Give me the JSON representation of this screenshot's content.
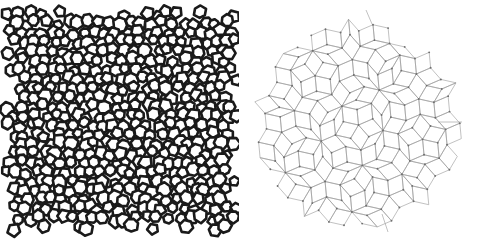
{
  "figure": {
    "background_color": "#ffffff",
    "width": 477,
    "height": 243,
    "panel_count": 2,
    "left_panel_caption": "",
    "right_panel_caption": ""
  },
  "panels": [
    {
      "id": "amorphous-network",
      "name": "Amorphous polygon network",
      "description": "Densely packed disordered network of thick-walled polygon rings (mostly pentagons and hexagons) filling a square region with ragged edges.",
      "style": {
        "line_color": "#1a1a1a",
        "fill_color": "#ffffff",
        "background_color": "#ffffff",
        "wall_thickness": 2.6,
        "ring_radius_mean": 6.2,
        "ring_radius_jitter": 1.1,
        "sides_min": 5,
        "sides_max": 7
      },
      "bounds": {
        "x": 9,
        "y": 14,
        "width": 225,
        "height": 214
      },
      "lattice": {
        "type": "jittered-triangular",
        "spacing": 10.6,
        "row_offset": 0.5,
        "jitter_amplitude": 2.9,
        "seed": 20240517
      }
    },
    {
      "id": "rhombus-tiling",
      "name": "Quasiperiodic rhombus tiling",
      "description": "Penrose-like tiling of fat and thin rhombi drawn with thin grey lines and small vertex dots, forming a roughly decagonal patch.",
      "style": {
        "line_color": "#9a9a9a",
        "vertex_color": "#6e6e6e",
        "fill_color": "none",
        "background_color": "#ffffff",
        "line_width": 0.62,
        "vertex_radius": 0.95,
        "edge_length": 15.5
      },
      "bounds": {
        "x": 262,
        "y": 20,
        "width": 193,
        "height": 210
      },
      "lattice": {
        "type": "de-bruijn-pentagrid",
        "symmetry": 5,
        "grid_lines_per_family": 9,
        "offsets": [
          0.18,
          0.31,
          0.22,
          0.14,
          0.27
        ],
        "clip_radius": 96
      },
      "whiskers": [
        {
          "name": "right-whisker",
          "x1": 438,
          "y1": 122,
          "x2": 462,
          "y2": 122
        },
        {
          "name": "top-whisker",
          "x1": 372,
          "y1": 24,
          "x2": 366,
          "y2": 10
        },
        {
          "name": "bottom-whisker",
          "x1": 382,
          "y1": 214,
          "x2": 388,
          "y2": 232
        }
      ]
    }
  ],
  "chart_data": {
    "type": "diagram",
    "title": "",
    "series": [
      {
        "name": "Amorphous network (left)",
        "motif": "polygon rings",
        "order": "disordered",
        "ring_sides": [
          5,
          6,
          7
        ],
        "approx_ring_count": 430
      },
      {
        "name": "Rhombus tiling (right)",
        "motif": "fat and thin rhombi",
        "order": "quasiperiodic",
        "symmetry": 5,
        "approx_tile_count": 260
      }
    ]
  }
}
